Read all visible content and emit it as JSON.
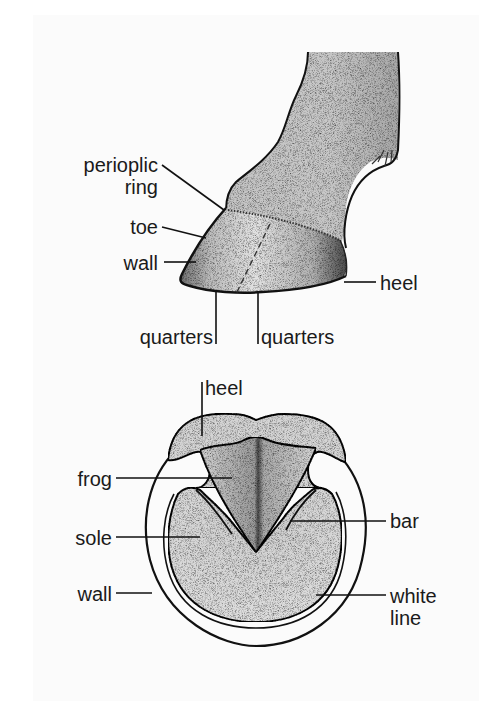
{
  "figure": {
    "side_view": {
      "labels": {
        "periople_line1": "perioplic",
        "periople_line2": "ring",
        "toe": "toe",
        "wall": "wall",
        "heel": "heel",
        "quarters_left": "quarters",
        "quarters_right": "quarters"
      }
    },
    "bottom_view": {
      "labels": {
        "heel": "heel",
        "frog": "frog",
        "sole": "sole",
        "wall": "wall",
        "bar": "bar",
        "white_line_1": "white",
        "white_line_2": "line"
      }
    }
  },
  "colors": {
    "background": "#ffffff",
    "panel": "#fbfbfb",
    "ink": "#1a1a1a",
    "shade_light": "#d6d6d6",
    "shade_mid": "#bdbdbd",
    "shade_dark": "#8a8a8a"
  }
}
